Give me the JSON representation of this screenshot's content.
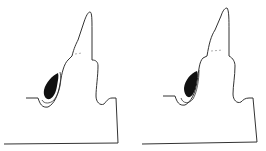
{
  "diagram": {
    "type": "dental cross-section line drawings",
    "panels": [
      {
        "id": "left",
        "description": "tooth profile with dark filled lesion on left flank, tip-shaped lesion"
      },
      {
        "id": "right",
        "description": "tooth profile with dark filled lesion on left flank, rounder lesion"
      }
    ],
    "colors": {
      "line": "#333333",
      "fill": "#111111",
      "background": "#ffffff"
    }
  }
}
